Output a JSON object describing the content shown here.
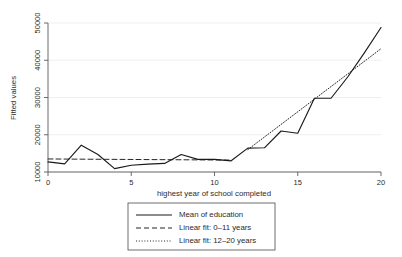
{
  "chart_data": {
    "type": "line",
    "title": "",
    "xlabel": "highest year of school completed",
    "ylabel": "Fitted values",
    "xlim": [
      0,
      20
    ],
    "ylim": [
      10000,
      50000
    ],
    "xticks": [
      0,
      5,
      10,
      15,
      20
    ],
    "xtick_labels": [
      "0",
      "5",
      "10",
      "15",
      "20"
    ],
    "yticks": [
      10000,
      20000,
      30000,
      40000,
      50000
    ],
    "ytick_labels": [
      "10000",
      "20000",
      "30000",
      "40000",
      "50000"
    ],
    "grid": true,
    "grid_axis": "y",
    "legend_position": "below-center",
    "x": [
      0,
      1,
      2,
      3,
      4,
      5,
      6,
      7,
      8,
      9,
      10,
      11,
      12,
      13,
      14,
      15,
      16,
      17,
      18,
      19,
      20
    ],
    "series": [
      {
        "name": "Mean of education",
        "style": "solid",
        "color": "#1a1a1a",
        "values": [
          12700,
          12200,
          17200,
          14700,
          10900,
          11800,
          12100,
          12300,
          14700,
          13400,
          13400,
          13000,
          16400,
          16500,
          21000,
          20400,
          29800,
          29800,
          35500,
          42000,
          48800
        ]
      },
      {
        "name": "Linear fit: 0–11 years",
        "style": "dashed",
        "color": "#1a1a1a",
        "x": [
          0,
          11
        ],
        "values": [
          13500,
          13200
        ]
      },
      {
        "name": "Linear fit: 12–20 years",
        "style": "dotted",
        "color": "#1a1a1a",
        "x": [
          12,
          20
        ],
        "values": [
          16000,
          43100
        ]
      }
    ]
  },
  "legend": {
    "entries": [
      {
        "label": "Mean of education",
        "style": "solid"
      },
      {
        "label": "Linear fit: 0–11 years",
        "style": "dashed"
      },
      {
        "label": "Linear fit: 12–20 years",
        "style": "dotted"
      }
    ]
  }
}
